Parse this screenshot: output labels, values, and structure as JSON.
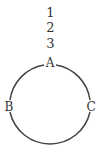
{
  "diagram": {
    "stack": [
      "1",
      "2",
      "3"
    ],
    "nodes": {
      "top": "A",
      "left": "B",
      "right": "C"
    },
    "circle": {
      "cx": 50,
      "cy": 106,
      "r": 41,
      "stroke": "#444444"
    }
  }
}
